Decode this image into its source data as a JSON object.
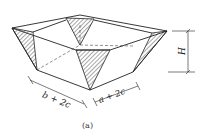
{
  "figure": {
    "caption": "(a)",
    "labels": {
      "width_left": "b + 2c",
      "width_right": "a + 2c",
      "height": "H"
    }
  },
  "colors": {
    "line": "#222222",
    "background": "#ffffff"
  }
}
